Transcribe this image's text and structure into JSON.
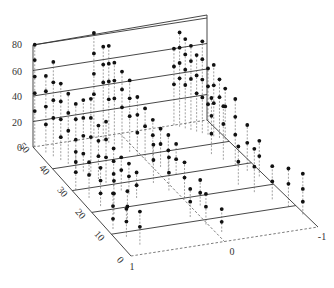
{
  "chart_data": {
    "type": "scatter",
    "subtype": "3d-stem",
    "title": "",
    "xlabel": "",
    "ylabel": "",
    "zlabel": "",
    "x_ticks": [
      "1",
      "0",
      "-1"
    ],
    "y_ticks": [
      "0",
      "10",
      "20",
      "30",
      "40",
      "50"
    ],
    "z_ticks": [
      "0",
      "20",
      "40",
      "60",
      "80"
    ],
    "xlim": [
      1,
      -1
    ],
    "ylim": [
      0,
      50
    ],
    "zlim": [
      0,
      80
    ],
    "grid": true,
    "legend": null,
    "projection": {
      "origin_back_left": [
        33,
        147
      ],
      "front_left": [
        131,
        256
      ],
      "front_right": [
        318,
        227
      ],
      "back_right": [
        207,
        120
      ],
      "z_px_per_unit": 1.275
    },
    "tick_positions": {
      "z": [
        [
          22,
          151
        ],
        [
          22,
          126
        ],
        [
          22,
          100
        ],
        [
          22,
          75
        ],
        [
          22,
          48
        ]
      ],
      "y": [
        [
          118,
          262
        ],
        [
          97,
          238
        ],
        [
          78,
          216
        ],
        [
          60,
          194
        ],
        [
          42,
          172
        ],
        [
          22,
          150
        ]
      ],
      "x": [
        [
          132,
          270
        ],
        [
          232,
          255
        ],
        [
          322,
          240
        ]
      ]
    },
    "stem_groups": [
      {
        "name": "left-group (x≈1 to 0.6)",
        "points": [
          [
            0.98,
            50,
            80
          ],
          [
            0.98,
            50,
            68
          ],
          [
            0.98,
            50,
            55
          ],
          [
            0.98,
            50,
            42
          ],
          [
            0.98,
            50,
            28
          ],
          [
            0.92,
            47,
            60
          ],
          [
            0.92,
            47,
            48
          ],
          [
            0.92,
            47,
            36
          ],
          [
            0.92,
            47,
            22
          ],
          [
            0.88,
            45,
            74
          ],
          [
            0.88,
            45,
            58
          ],
          [
            0.88,
            45,
            44
          ],
          [
            0.88,
            45,
            30
          ],
          [
            0.84,
            43,
            60
          ],
          [
            0.84,
            43,
            46
          ],
          [
            0.84,
            43,
            32
          ],
          [
            0.84,
            43,
            18
          ],
          [
            0.8,
            41,
            55
          ],
          [
            0.8,
            41,
            40
          ],
          [
            0.8,
            41,
            26
          ],
          [
            0.76,
            39,
            50
          ],
          [
            0.76,
            39,
            38
          ],
          [
            0.76,
            39,
            22
          ],
          [
            0.72,
            37,
            56
          ],
          [
            0.72,
            37,
            42
          ],
          [
            0.72,
            37,
            28
          ],
          [
            0.72,
            37,
            14
          ],
          [
            0.68,
            35,
            60
          ],
          [
            0.68,
            35,
            45
          ],
          [
            0.68,
            35,
            30
          ],
          [
            0.64,
            33,
            42
          ],
          [
            0.64,
            33,
            30
          ],
          [
            0.64,
            33,
            18
          ],
          [
            0.6,
            31,
            48
          ],
          [
            0.6,
            31,
            34
          ],
          [
            0.6,
            31,
            20
          ],
          [
            0.56,
            29,
            30
          ],
          [
            0.56,
            29,
            20
          ],
          [
            0.56,
            29,
            10
          ],
          [
            0.52,
            27,
            26
          ],
          [
            0.52,
            27,
            16
          ],
          [
            0.48,
            25,
            24
          ],
          [
            0.48,
            25,
            14
          ],
          [
            0.44,
            23,
            20
          ],
          [
            0.44,
            23,
            10
          ],
          [
            0.96,
            30,
            30
          ],
          [
            0.96,
            30,
            22
          ],
          [
            0.96,
            30,
            14
          ],
          [
            0.9,
            26,
            28
          ],
          [
            0.9,
            26,
            18
          ],
          [
            0.86,
            22,
            30
          ],
          [
            0.86,
            22,
            20
          ],
          [
            0.86,
            22,
            10
          ],
          [
            0.8,
            18,
            26
          ],
          [
            0.8,
            18,
            16
          ],
          [
            0.74,
            14,
            24
          ],
          [
            0.74,
            14,
            12
          ],
          [
            0.94,
            12,
            28
          ],
          [
            0.94,
            12,
            18
          ],
          [
            0.94,
            12,
            8
          ],
          [
            0.88,
            8,
            22
          ],
          [
            0.88,
            8,
            12
          ],
          [
            0.82,
            4,
            26
          ],
          [
            0.82,
            4,
            14
          ]
        ]
      },
      {
        "name": "middle-group (x≈0.3 to -0.2)",
        "points": [
          [
            0.3,
            50,
            82
          ],
          [
            0.3,
            50,
            66
          ],
          [
            0.3,
            50,
            50
          ],
          [
            0.3,
            50,
            34
          ],
          [
            0.24,
            48,
            74
          ],
          [
            0.24,
            48,
            60
          ],
          [
            0.24,
            48,
            46
          ],
          [
            0.2,
            47,
            76
          ],
          [
            0.2,
            47,
            62
          ],
          [
            0.2,
            47,
            48
          ],
          [
            0.2,
            47,
            34
          ],
          [
            0.16,
            46,
            64
          ],
          [
            0.16,
            46,
            50
          ],
          [
            0.16,
            46,
            36
          ],
          [
            0.12,
            44,
            60
          ],
          [
            0.12,
            44,
            46
          ],
          [
            0.12,
            44,
            32
          ],
          [
            0.08,
            42,
            56
          ],
          [
            0.08,
            42,
            42
          ],
          [
            0.08,
            42,
            28
          ],
          [
            0.04,
            40,
            46
          ],
          [
            0.04,
            40,
            32
          ],
          [
            0.04,
            40,
            18
          ],
          [
            0.0,
            38,
            40
          ],
          [
            0.0,
            38,
            26
          ],
          [
            -0.04,
            36,
            34
          ],
          [
            -0.04,
            36,
            22
          ],
          [
            -0.08,
            34,
            30
          ],
          [
            -0.08,
            34,
            18
          ],
          [
            -0.12,
            32,
            28
          ],
          [
            -0.12,
            32,
            16
          ],
          [
            -0.16,
            30,
            24
          ],
          [
            -0.16,
            30,
            12
          ],
          [
            0.14,
            28,
            30
          ],
          [
            0.14,
            28,
            18
          ],
          [
            0.06,
            24,
            26
          ],
          [
            0.06,
            24,
            14
          ],
          [
            -0.02,
            20,
            28
          ],
          [
            -0.02,
            20,
            16
          ],
          [
            -0.1,
            16,
            20
          ],
          [
            -0.1,
            16,
            10
          ],
          [
            0.1,
            12,
            22
          ],
          [
            0.1,
            12,
            12
          ],
          [
            0.02,
            8,
            24
          ],
          [
            0.02,
            8,
            14
          ],
          [
            -0.06,
            4,
            18
          ],
          [
            -0.06,
            4,
            8
          ]
        ]
      },
      {
        "name": "right-group (x≈-0.6 to -1)",
        "points": [
          [
            -0.62,
            50,
            60
          ],
          [
            -0.62,
            50,
            46
          ],
          [
            -0.62,
            50,
            32
          ],
          [
            -0.66,
            49,
            74
          ],
          [
            -0.66,
            49,
            62
          ],
          [
            -0.66,
            49,
            50
          ],
          [
            -0.66,
            49,
            38
          ],
          [
            -0.7,
            48,
            70
          ],
          [
            -0.7,
            48,
            58
          ],
          [
            -0.7,
            48,
            46
          ],
          [
            -0.7,
            48,
            34
          ],
          [
            -0.74,
            47,
            66
          ],
          [
            -0.74,
            47,
            54
          ],
          [
            -0.74,
            47,
            40
          ],
          [
            -0.78,
            46,
            60
          ],
          [
            -0.78,
            46,
            44
          ],
          [
            -0.78,
            46,
            30
          ],
          [
            -0.82,
            45,
            72
          ],
          [
            -0.82,
            45,
            58
          ],
          [
            -0.82,
            45,
            42
          ],
          [
            -0.82,
            45,
            28
          ],
          [
            -0.86,
            44,
            52
          ],
          [
            -0.86,
            44,
            38
          ],
          [
            -0.86,
            44,
            24
          ],
          [
            -0.9,
            43,
            56
          ],
          [
            -0.9,
            43,
            40
          ],
          [
            -0.9,
            43,
            26
          ],
          [
            -0.94,
            42,
            46
          ],
          [
            -0.94,
            42,
            32
          ],
          [
            -0.98,
            41,
            40
          ],
          [
            -0.98,
            41,
            26
          ],
          [
            -0.7,
            36,
            44
          ],
          [
            -0.7,
            36,
            30
          ],
          [
            -0.7,
            36,
            16
          ],
          [
            -0.76,
            33,
            42
          ],
          [
            -0.76,
            33,
            28
          ],
          [
            -0.82,
            30,
            52
          ],
          [
            -0.82,
            30,
            38
          ],
          [
            -0.82,
            30,
            24
          ],
          [
            -0.88,
            27,
            36
          ],
          [
            -0.88,
            27,
            22
          ],
          [
            -0.94,
            24,
            28
          ],
          [
            -0.94,
            24,
            16
          ],
          [
            -0.66,
            22,
            30
          ],
          [
            -0.66,
            22,
            18
          ],
          [
            -0.74,
            18,
            34
          ],
          [
            -0.74,
            18,
            20
          ],
          [
            -0.84,
            14,
            26
          ],
          [
            -0.84,
            14,
            14
          ],
          [
            -0.92,
            10,
            30
          ],
          [
            -0.92,
            10,
            18
          ],
          [
            -0.98,
            6,
            32
          ],
          [
            -0.98,
            6,
            20
          ],
          [
            -0.98,
            6,
            10
          ]
        ]
      }
    ]
  }
}
